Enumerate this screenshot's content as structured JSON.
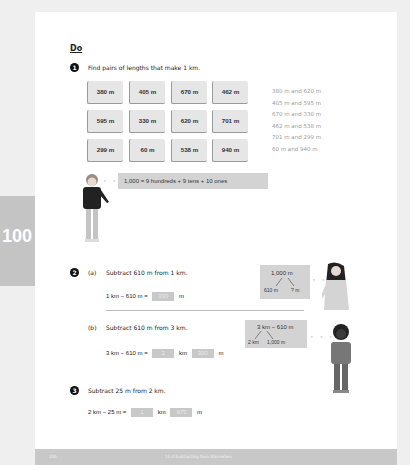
{
  "section_title": "Do",
  "page_number_tab": "100",
  "q1": {
    "number": "1",
    "prompt": "Find pairs of lengths that make 1 km.",
    "cards": [
      [
        "380 m",
        "405 m",
        "670 m",
        "462 m"
      ],
      [
        "595 m",
        "330 m",
        "620 m",
        "701 m"
      ],
      [
        "299 m",
        "60 m",
        "538 m",
        "940 m"
      ]
    ],
    "answers": [
      "380 m and 620 m",
      "405 m and 595 m",
      "670 m and 330 m",
      "462 m and 538 m",
      "701 m and 299 m",
      "60 m and 940 m"
    ],
    "thought": "1,000 = 9 hundreds + 9 tens + 10 ones"
  },
  "q2": {
    "number": "2",
    "a": {
      "label": "(a)",
      "prompt": "Subtract 610 m from 1 km.",
      "eq_left": "1 km − 610 m =",
      "answer": "390",
      "unit": "m",
      "bubble": {
        "top": "1,000 m",
        "left": "610 m",
        "right": "? m"
      }
    },
    "b": {
      "label": "(b)",
      "prompt": "Subtract 610 m from 3 km.",
      "eq_left": "3 km − 610 m =",
      "answer_km": "2",
      "unit_km": "km",
      "answer_m": "390",
      "unit_m": "m",
      "bubble": {
        "top": "3 km − 610 m",
        "left": "2 km",
        "right": "1,000 m"
      }
    }
  },
  "q3": {
    "number": "3",
    "prompt": "Subtract 25 m from 2 km.",
    "eq_left": "2 km − 25 m =",
    "answer_km": "1",
    "unit_km": "km",
    "answer_m": "975",
    "unit_m": "m"
  },
  "footer": {
    "page": "100",
    "title": "11-4  Subtracting from Kilometers"
  }
}
